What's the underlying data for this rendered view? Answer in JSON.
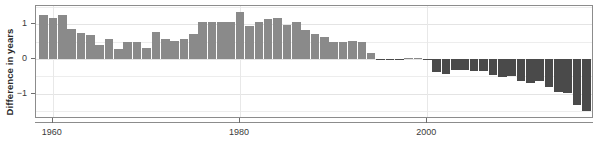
{
  "chart_data": {
    "type": "bar",
    "title": "",
    "subtitle": "",
    "xlabel": "",
    "ylabel": "Difference in years",
    "xlim": [
      1958.2,
      2017.8
    ],
    "ylim": [
      -1.72,
      1.52
    ],
    "grid": true,
    "grid_axis": "both",
    "legend": false,
    "legend_position": "none",
    "y_ticks": [
      1,
      0,
      -1
    ],
    "y_tick_labels": [
      "1",
      "0",
      "−1"
    ],
    "y_gridlines": [
      1.5,
      1.0,
      0.5,
      0.0,
      -0.5,
      -1.0,
      -1.5
    ],
    "x_ticks": [
      1960,
      1980,
      2000
    ],
    "x_tick_labels": [
      "1960",
      "1980",
      "2000"
    ],
    "colors": {
      "positive_bar": "#8a8a8a",
      "negative_bar": "#4a4a4a",
      "gridline": "#ededed",
      "axis": "#8c8c8c",
      "tick_text": "#3a3a3a",
      "axis_label": "#2b2b2b",
      "background": "#ffffff"
    },
    "categories": [
      1959,
      1960,
      1961,
      1962,
      1963,
      1964,
      1965,
      1966,
      1967,
      1968,
      1969,
      1970,
      1971,
      1972,
      1973,
      1974,
      1975,
      1976,
      1977,
      1978,
      1979,
      1980,
      1981,
      1982,
      1983,
      1984,
      1985,
      1986,
      1987,
      1988,
      1989,
      1990,
      1991,
      1992,
      1993,
      1994,
      1995,
      1996,
      1997,
      1998,
      1999,
      2000,
      2001,
      2002,
      2003,
      2004,
      2005,
      2006,
      2007,
      2008,
      2009,
      2010,
      2011,
      2012,
      2013,
      2014,
      2015,
      2016,
      2017
    ],
    "values": [
      1.25,
      1.17,
      1.27,
      0.87,
      0.76,
      0.68,
      0.39,
      0.58,
      0.28,
      0.48,
      0.49,
      0.31,
      0.77,
      0.58,
      0.53,
      0.57,
      0.73,
      1.05,
      1.05,
      1.05,
      1.07,
      1.35,
      0.94,
      1.05,
      1.15,
      1.18,
      0.98,
      1.06,
      0.84,
      0.71,
      0.62,
      0.48,
      0.5,
      0.51,
      0.5,
      0.17,
      -0.03,
      -0.04,
      -0.04,
      0.02,
      0.02,
      -0.04,
      -0.36,
      -0.44,
      -0.31,
      -0.32,
      -0.33,
      -0.34,
      -0.45,
      -0.52,
      -0.5,
      -0.62,
      -0.68,
      -0.64,
      -0.8,
      -0.95,
      -0.98,
      -1.33,
      -1.5
    ]
  }
}
